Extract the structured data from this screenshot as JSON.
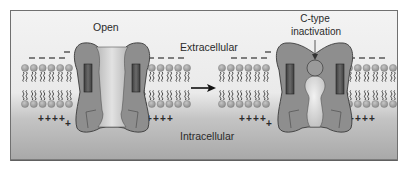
{
  "labels": {
    "open": "Open",
    "extracellular": "Extracellular",
    "intracellular": "Intracellular",
    "c_type_line1": "C-type",
    "c_type_line2": "inactivation"
  },
  "membrane": {
    "outer_charge": "−",
    "inner_charge": "+",
    "lipids_per_group": 6,
    "groups_x": [
      22,
      140,
      218,
      346
    ]
  },
  "states": [
    {
      "name": "open",
      "channel_x": 73
    },
    {
      "name": "c-type-inactivated",
      "channel_x": 276
    }
  ],
  "colors": {
    "frame_border": "#6e6e6e",
    "bg_top": "#f2f2f2",
    "bg_bottom": "#a9a9a9",
    "channel_fill": "#8c8c8c",
    "channel_stroke": "#3c3c3c",
    "pore_fill": "#cfcfcf",
    "helix_fill": "#555555",
    "lipid_head": "#9a9a9a",
    "text": "#2a2a2a"
  }
}
